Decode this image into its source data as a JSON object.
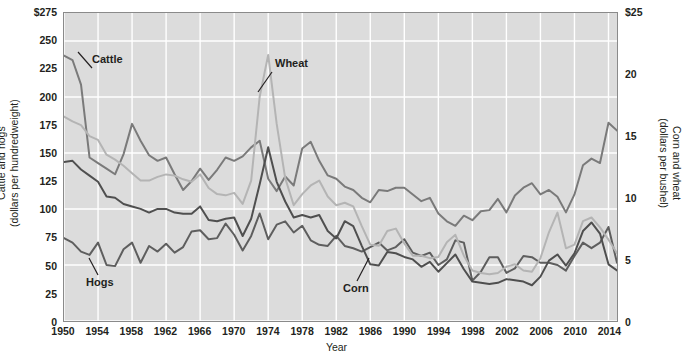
{
  "chart_data": {
    "type": "line",
    "title": "",
    "xlabel": "Year",
    "ylabel": "Cattle and hogs (dollars per hundredweight)",
    "y2label": "Corn and wheat (dollars per bushel)",
    "grid": true,
    "legend": "inline-annotations",
    "background_color": "#dcdcdc",
    "gridline_color": "#ffffff",
    "xlim": [
      1950,
      2015
    ],
    "ylim": [
      0,
      275
    ],
    "y2lim": [
      0,
      25
    ],
    "x_ticks": [
      1950,
      1954,
      1958,
      1962,
      1966,
      1970,
      1974,
      1978,
      1982,
      1986,
      1990,
      1994,
      1998,
      2002,
      2006,
      2010,
      2014
    ],
    "y_ticks_left": [
      "0",
      "25",
      "50",
      "75",
      "100",
      "125",
      "150",
      "175",
      "200",
      "225",
      "250",
      "$275"
    ],
    "y_ticks_right": [
      "0",
      "5",
      "10",
      "15",
      "20",
      "$25"
    ],
    "x": [
      1950,
      1951,
      1952,
      1953,
      1954,
      1955,
      1956,
      1957,
      1958,
      1959,
      1960,
      1961,
      1962,
      1963,
      1964,
      1965,
      1966,
      1967,
      1968,
      1969,
      1970,
      1971,
      1972,
      1973,
      1974,
      1975,
      1976,
      1977,
      1978,
      1979,
      1980,
      1981,
      1982,
      1983,
      1984,
      1985,
      1986,
      1987,
      1988,
      1989,
      1990,
      1991,
      1992,
      1993,
      1994,
      1995,
      1996,
      1997,
      1998,
      1999,
      2000,
      2001,
      2002,
      2003,
      2004,
      2005,
      2006,
      2007,
      2008,
      2009,
      2010,
      2011,
      2012,
      2013,
      2014,
      2015
    ],
    "series": [
      {
        "name": "Cattle",
        "axis": "left",
        "units": "dollars per hundredweight",
        "color": "#7a7a7a",
        "values": [
          237,
          233,
          211,
          146,
          141,
          136,
          131,
          149,
          176,
          161,
          148,
          143,
          146,
          131,
          117,
          125,
          136,
          126,
          135,
          146,
          143,
          147,
          155,
          161,
          127,
          116,
          129,
          121,
          154,
          160,
          143,
          130,
          127,
          120,
          117,
          110,
          106,
          117,
          116,
          119,
          119,
          113,
          107,
          110,
          96,
          89,
          85,
          94,
          90,
          98,
          99,
          109,
          97,
          112,
          119,
          123,
          113,
          117,
          111,
          97,
          113,
          139,
          145,
          141,
          177,
          170
        ]
      },
      {
        "name": "Hogs",
        "axis": "left",
        "units": "dollars per hundredweight",
        "color": "#5e5e5e",
        "values": [
          74,
          70,
          62,
          59,
          70,
          50,
          49,
          64,
          70,
          52,
          67,
          62,
          69,
          61,
          66,
          80,
          81,
          73,
          74,
          87,
          77,
          63,
          76,
          96,
          73,
          86,
          89,
          79,
          85,
          72,
          68,
          67,
          76,
          67,
          65,
          62,
          66,
          70,
          63,
          66,
          73,
          61,
          58,
          61,
          50,
          55,
          72,
          70,
          36,
          44,
          57,
          57,
          43,
          47,
          58,
          57,
          52,
          52,
          50,
          45,
          58,
          70,
          65,
          70,
          84,
          52
        ]
      },
      {
        "name": "Corn",
        "axis": "right",
        "units": "dollars per bushel",
        "color": "#4f4f4f",
        "values": [
          12.9,
          13.0,
          12.3,
          11.8,
          11.3,
          10.1,
          10.0,
          9.5,
          9.3,
          9.1,
          8.8,
          9.1,
          9.1,
          8.8,
          8.7,
          8.7,
          9.3,
          8.2,
          8.1,
          8.3,
          8.4,
          6.9,
          8.3,
          11.1,
          14.1,
          11.3,
          9.7,
          8.4,
          8.6,
          8.4,
          8.6,
          7.3,
          6.7,
          8.1,
          7.7,
          6.1,
          4.6,
          4.5,
          5.6,
          5.5,
          5.2,
          5.0,
          4.4,
          4.8,
          4.0,
          4.7,
          5.4,
          4.2,
          3.2,
          3.1,
          3.0,
          3.1,
          3.4,
          3.3,
          3.2,
          2.9,
          3.6,
          4.9,
          5.4,
          4.5,
          5.5,
          7.3,
          8.0,
          7.1,
          4.6,
          4.1
        ]
      },
      {
        "name": "Wheat",
        "axis": "right",
        "units": "dollars per bushel",
        "color": "#b4b4b4",
        "values": [
          16.6,
          16.2,
          15.9,
          15.0,
          14.7,
          13.5,
          13.1,
          12.6,
          12.0,
          11.4,
          11.4,
          11.7,
          11.9,
          11.8,
          11.5,
          11.3,
          11.9,
          10.8,
          10.3,
          10.2,
          10.4,
          9.5,
          11.4,
          18.2,
          21.6,
          16.0,
          11.6,
          9.4,
          10.3,
          11.0,
          11.4,
          10.1,
          9.4,
          9.6,
          9.3,
          7.7,
          6.2,
          6.1,
          7.3,
          7.5,
          6.3,
          5.3,
          5.3,
          5.1,
          5.2,
          6.4,
          7.0,
          5.3,
          4.1,
          3.9,
          3.8,
          3.9,
          4.4,
          4.6,
          4.1,
          4.0,
          5.1,
          7.2,
          8.8,
          5.9,
          6.2,
          8.1,
          8.4,
          7.6,
          6.6,
          5.5
        ]
      }
    ],
    "annotations": [
      {
        "text": "Cattle",
        "series": "Cattle"
      },
      {
        "text": "Wheat",
        "series": "Wheat"
      },
      {
        "text": "Hogs",
        "series": "Hogs"
      },
      {
        "text": "Corn",
        "series": "Corn"
      }
    ]
  }
}
